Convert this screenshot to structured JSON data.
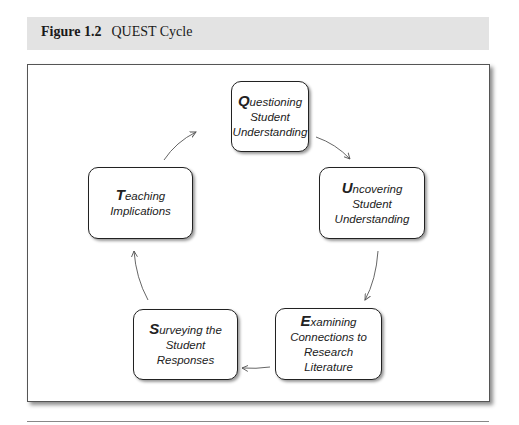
{
  "figure": {
    "number": "Figure 1.2",
    "title": "QUEST Cycle"
  },
  "nodes": [
    {
      "id": "q",
      "initial": "Q",
      "first_word_rest": "uestioning",
      "lines": [
        "Student",
        "Understanding"
      ]
    },
    {
      "id": "u",
      "initial": "U",
      "first_word_rest": "ncovering",
      "lines": [
        "Student",
        "Understanding"
      ]
    },
    {
      "id": "e",
      "initial": "E",
      "first_word_rest": "xamining",
      "lines": [
        "Connections to",
        "Research",
        "Literature"
      ]
    },
    {
      "id": "s",
      "initial": "S",
      "first_word_rest": "urveying the",
      "lines": [
        "Student",
        "Responses"
      ]
    },
    {
      "id": "t",
      "initial": "T",
      "first_word_rest": "eaching",
      "lines": [
        "Implications"
      ]
    }
  ],
  "edges": [
    {
      "from": "Q",
      "to": "U"
    },
    {
      "from": "U",
      "to": "E"
    },
    {
      "from": "E",
      "to": "S"
    },
    {
      "from": "S",
      "to": "T"
    },
    {
      "from": "T",
      "to": "Q"
    }
  ],
  "colors": {
    "header_band": "#e3e3e3",
    "box_border": "#222222",
    "arrow": "#555555"
  }
}
